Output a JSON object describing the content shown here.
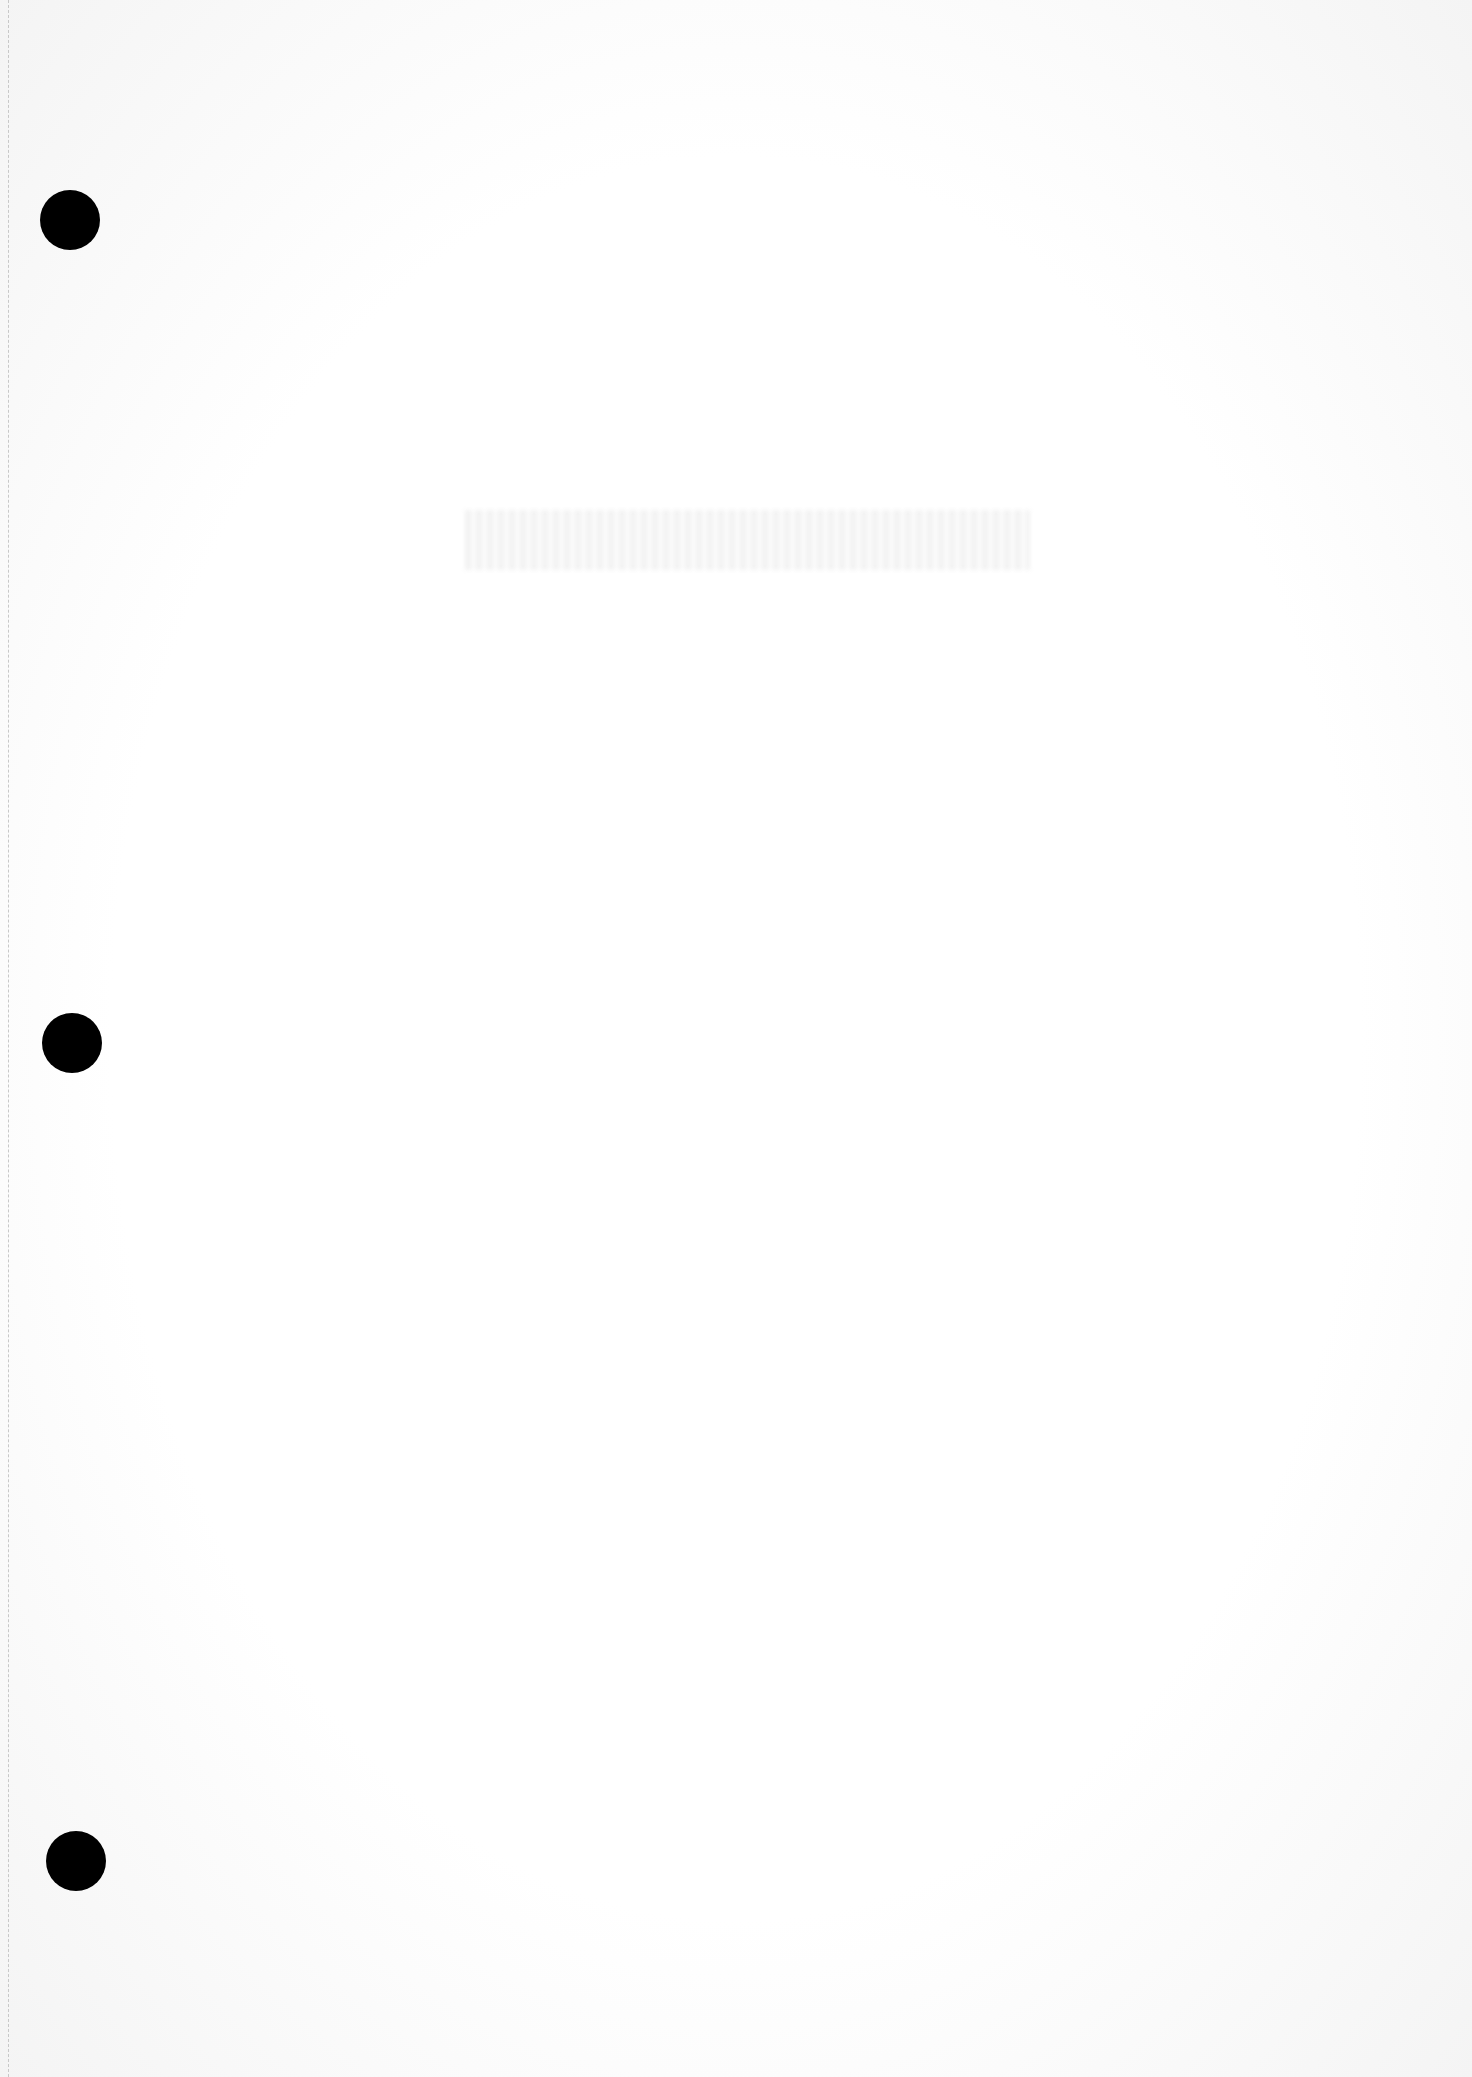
{
  "document": {
    "type": "blank lined-less binder sheet",
    "ghost_text": "",
    "binder_holes": [
      {
        "cx": 70,
        "cy": 220,
        "r": 30
      },
      {
        "cx": 72,
        "cy": 1043,
        "r": 30
      },
      {
        "cx": 76,
        "cy": 1861,
        "r": 30
      }
    ],
    "colors": {
      "paper": "#fdfdfd",
      "hole": "#000000",
      "perforation": "#c8c8c8"
    }
  }
}
